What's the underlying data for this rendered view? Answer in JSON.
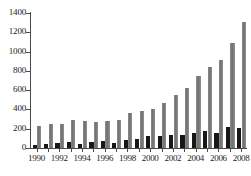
{
  "chart_data": {
    "type": "bar",
    "title": "",
    "subtitle": "",
    "xlabel": "",
    "ylabel": "",
    "ylim": [
      0,
      1400
    ],
    "ytick_labels": [
      "0",
      "200",
      "400",
      "600",
      "800",
      "1000",
      "1200",
      "1400"
    ],
    "yticks": [
      0,
      200,
      400,
      600,
      800,
      1000,
      1200,
      1400
    ],
    "grid": false,
    "legend": null,
    "categories": [
      "1990",
      "1991",
      "1992",
      "1993",
      "1994",
      "1995",
      "1996",
      "1997",
      "1998",
      "1999",
      "2000",
      "2001",
      "2002",
      "2003",
      "2004",
      "2005",
      "2006",
      "2007",
      "2008"
    ],
    "xtick_labels_shown": [
      "1990",
      "1992",
      "1994",
      "1996",
      "1998",
      "2000",
      "2002",
      "2004",
      "2006",
      "2008"
    ],
    "series": [
      {
        "name": "dark-series",
        "color": "#171717",
        "values": [
          35,
          40,
          50,
          62,
          40,
          60,
          68,
          55,
          85,
          95,
          125,
          125,
          130,
          138,
          160,
          175,
          155,
          220,
          205
        ]
      },
      {
        "name": "gray-series",
        "color": "#7a7a7a",
        "values": [
          230,
          245,
          248,
          295,
          280,
          272,
          275,
          288,
          365,
          385,
          405,
          465,
          548,
          620,
          748,
          840,
          910,
          1090,
          1310
        ]
      }
    ]
  }
}
